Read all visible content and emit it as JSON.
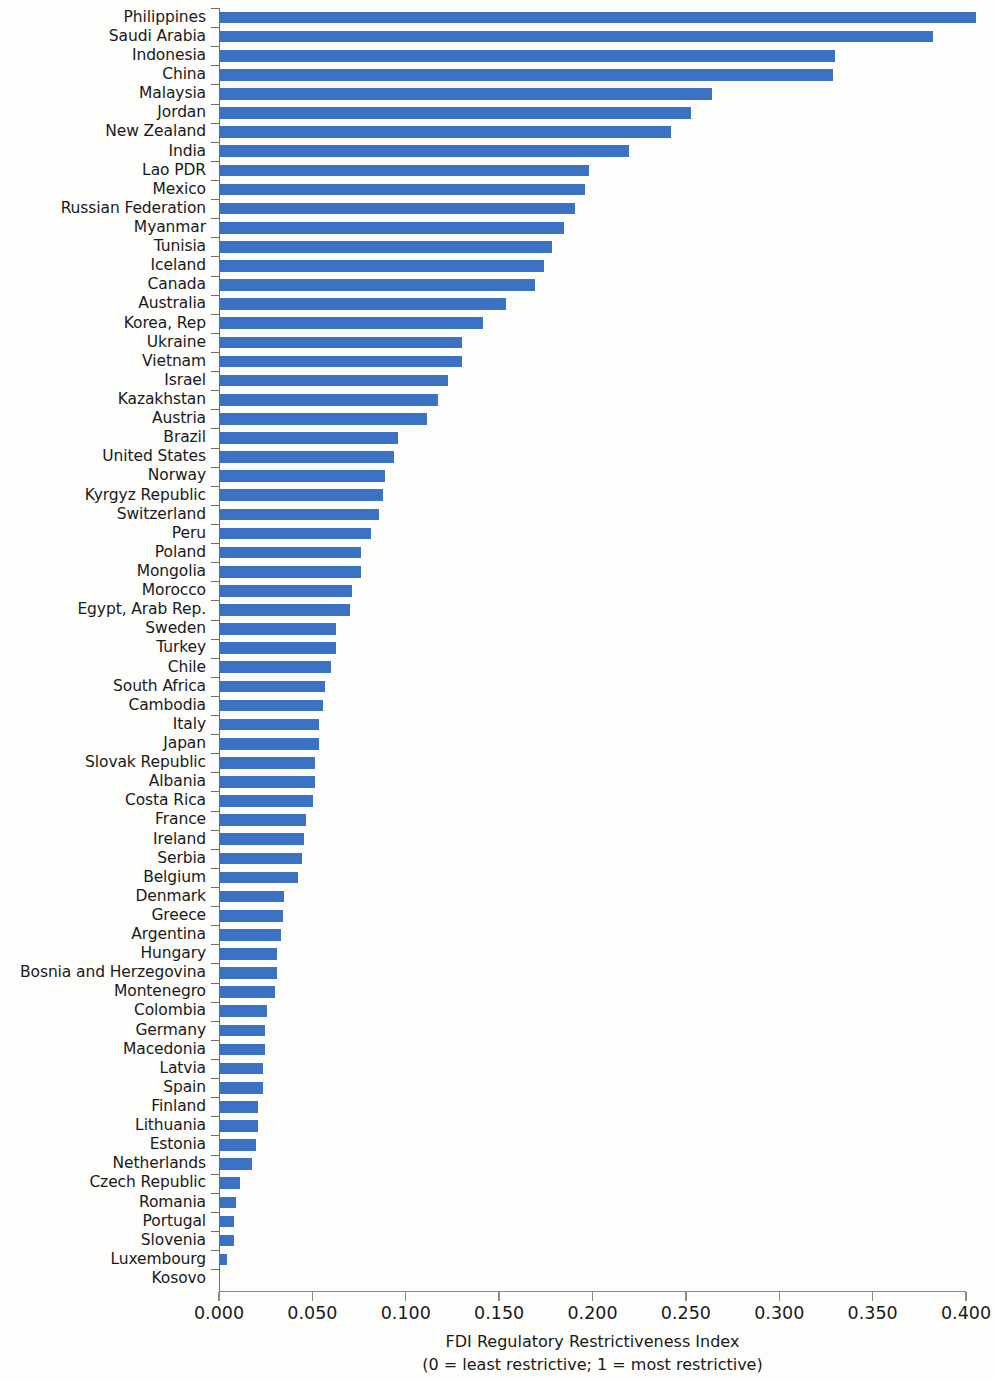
{
  "chart_data": {
    "type": "bar",
    "orientation": "horizontal",
    "title": "",
    "xlabel": "FDI Regulatory Restrictiveness Index",
    "xlabel_note": "(0 = least restrictive; 1 = most restrictive)",
    "ylabel": "",
    "xlim": [
      0.0,
      0.4
    ],
    "grid": false,
    "legend": null,
    "bar_color": "#3b72c4",
    "axis_color": "#6d6d66",
    "background_color": "#fdfdfb",
    "xticks": [
      0.0,
      0.05,
      0.1,
      0.15,
      0.2,
      0.25,
      0.3,
      0.35,
      0.4
    ],
    "xtick_labels": [
      "0.000",
      "0.050",
      "0.100",
      "0.150",
      "0.200",
      "0.250",
      "0.300",
      "0.350",
      "0.400"
    ],
    "categories": [
      "Philippines",
      "Saudi Arabia",
      "Indonesia",
      "China",
      "Malaysia",
      "Jordan",
      "New Zealand",
      "India",
      "Lao PDR",
      "Mexico",
      "Russian Federation",
      "Myanmar",
      "Tunisia",
      "Iceland",
      "Canada",
      "Australia",
      "Korea, Rep",
      "Ukraine",
      "Vietnam",
      "Israel",
      "Kazakhstan",
      "Austria",
      "Brazil",
      "United States",
      "Norway",
      "Kyrgyz Republic",
      "Switzerland",
      "Peru",
      "Poland",
      "Mongolia",
      "Morocco",
      "Egypt, Arab Rep.",
      "Sweden",
      "Turkey",
      "Chile",
      "South Africa",
      "Cambodia",
      "Italy",
      "Japan",
      "Slovak Republic",
      "Albania",
      "Costa Rica",
      "France",
      "Ireland",
      "Serbia",
      "Belgium",
      "Denmark",
      "Greece",
      "Argentina",
      "Hungary",
      "Bosnia and Herzegovina",
      "Montenegro",
      "Colombia",
      "Germany",
      "Macedonia",
      "Latvia",
      "Spain",
      "Finland",
      "Lithuania",
      "Estonia",
      "Netherlands",
      "Czech Republic",
      "Romania",
      "Portugal",
      "Slovenia",
      "Luxembourg",
      "Kosovo"
    ],
    "values": [
      0.393,
      0.371,
      0.32,
      0.319,
      0.256,
      0.245,
      0.235,
      0.213,
      0.192,
      0.19,
      0.185,
      0.179,
      0.173,
      0.169,
      0.164,
      0.149,
      0.137,
      0.126,
      0.126,
      0.119,
      0.114,
      0.108,
      0.093,
      0.091,
      0.086,
      0.085,
      0.083,
      0.079,
      0.074,
      0.074,
      0.069,
      0.068,
      0.061,
      0.061,
      0.058,
      0.055,
      0.054,
      0.052,
      0.052,
      0.05,
      0.05,
      0.049,
      0.045,
      0.044,
      0.043,
      0.041,
      0.034,
      0.033,
      0.032,
      0.03,
      0.03,
      0.029,
      0.025,
      0.024,
      0.024,
      0.023,
      0.023,
      0.02,
      0.02,
      0.019,
      0.017,
      0.011,
      0.009,
      0.008,
      0.008,
      0.004,
      0.0
    ]
  }
}
